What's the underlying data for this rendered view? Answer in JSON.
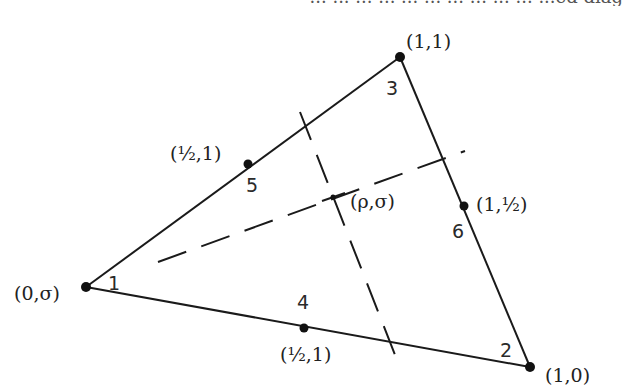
{
  "top_text_fragment": "... ... ... ...  ... ... ... ...  ... ... ...ed diag",
  "figure": {
    "type": "triangle-element-diagram",
    "colors": {
      "edge": "#1a1a1a",
      "dashed": "#1a1a1a",
      "node": "#111111",
      "text": "#222222"
    },
    "vertices": [
      {
        "id": 1,
        "label": "(0,σ)",
        "number": "1",
        "x": 86,
        "y": 287
      },
      {
        "id": 2,
        "label": "(1,0)",
        "number": "2",
        "x": 530,
        "y": 367
      },
      {
        "id": 3,
        "label": "(1,1)",
        "number": "3",
        "x": 400,
        "y": 57
      }
    ],
    "midpoints": [
      {
        "id": 4,
        "label": "(½,1)",
        "number": "4",
        "x": 304,
        "y": 328
      },
      {
        "id": 5,
        "label": "(½,1)",
        "number": "5",
        "x": 248,
        "y": 164
      },
      {
        "id": 6,
        "label": "(1,½)",
        "number": "6",
        "x": 464,
        "y": 206
      }
    ],
    "interior_point": {
      "label": "(ρ,σ)",
      "x": 333,
      "y": 197
    },
    "dashed_lines": [
      {
        "name": "dashed-line-through-point-toward-edge-2-3",
        "x1": 158,
        "y1": 262,
        "x2": 465,
        "y2": 151
      },
      {
        "name": "dashed-line-through-point-toward-edge-1-2",
        "x1": 300,
        "y1": 112,
        "x2": 397,
        "y2": 360
      }
    ]
  }
}
